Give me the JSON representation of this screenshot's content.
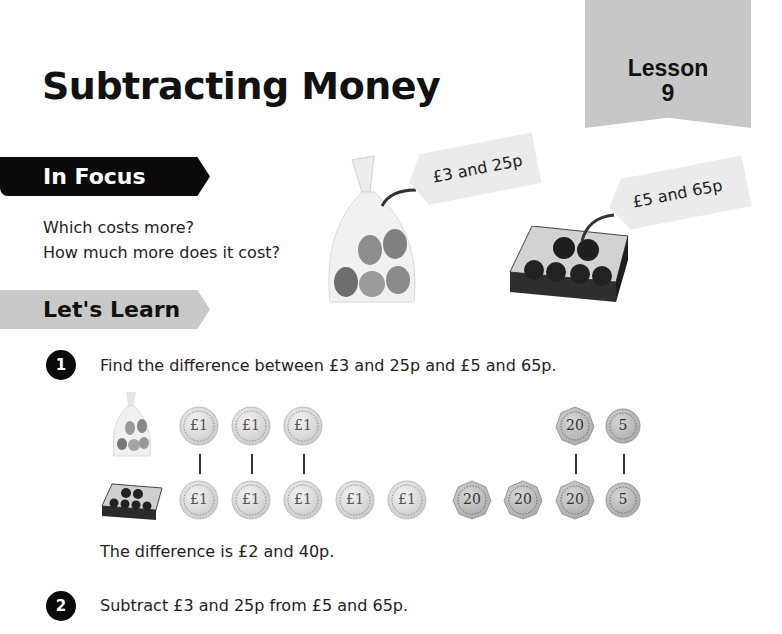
{
  "page": {
    "title": "Subtracting Money",
    "lesson_label": "Lesson",
    "lesson_number": "9"
  },
  "in_focus": {
    "heading": "In Focus",
    "questions": [
      "Which costs more?",
      "How much more does it cost?"
    ],
    "items": [
      {
        "name": "bag of pears",
        "price_tag": "£3 and 25p"
      },
      {
        "name": "box of apples",
        "price_tag": "£5 and 65p"
      }
    ]
  },
  "lets_learn": {
    "heading": "Let's Learn",
    "steps": [
      {
        "number": "1",
        "instruction": "Find the difference between £3 and 25p and £5 and 65p.",
        "top_row_coins": [
          "£1",
          "£1",
          "£1",
          "20",
          "5"
        ],
        "bottom_row_coins": [
          "£1",
          "£1",
          "£1",
          "£1",
          "£1",
          "20",
          "20",
          "20",
          "5"
        ],
        "result": "The difference is £2 and 40p."
      },
      {
        "number": "2",
        "instruction": "Subtract £3 and 25p from £5 and 65p."
      }
    ]
  },
  "coin_labels": {
    "pound": "£1",
    "twenty": "20",
    "five": "5"
  },
  "colors": {
    "banner_dark": "#0a0a0a",
    "banner_light": "#c9c9c9",
    "lesson_tab": "#c7c7c7",
    "coin_silver": "#d9d9d9"
  }
}
